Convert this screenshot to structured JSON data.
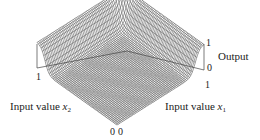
{
  "chart_data": {
    "type": "surface3d",
    "title": "",
    "xlabel": "Input value x1",
    "ylabel": "Input value x2",
    "zlabel": "Output",
    "x_ticks": [
      "0",
      "1"
    ],
    "y_ticks": [
      "0",
      "1"
    ],
    "z_ticks": [
      "0",
      "1"
    ],
    "xlim": [
      0,
      1
    ],
    "ylim": [
      0,
      1
    ],
    "zlim": [
      0,
      1
    ],
    "grid": true,
    "legend": null,
    "surface_samples": {
      "x": [
        0,
        0.25,
        0.5,
        0.75,
        0.9,
        1
      ],
      "note": "output along a back edge cross-section",
      "z": [
        0,
        0,
        0.02,
        0.1,
        0.8,
        1
      ]
    },
    "line_color": "#555555"
  },
  "labels": {
    "output": "Output",
    "x1_prefix": "Input value ",
    "x1_var": "x",
    "x1_sub": "1",
    "x2_prefix": "Input value ",
    "x2_var": "x",
    "x2_sub": "2",
    "z_top": "1",
    "z_bottom": "0",
    "x1_max": "1",
    "x2_max": "1",
    "origin_x1": "0",
    "origin_x2": "0"
  }
}
